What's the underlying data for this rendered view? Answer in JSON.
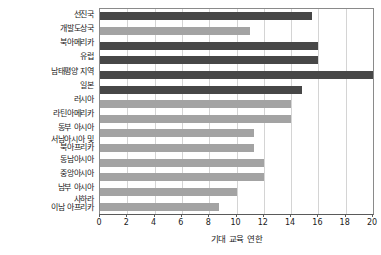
{
  "chart_data": {
    "type": "bar",
    "orientation": "horizontal",
    "title": "",
    "xlabel": "기대 교육 연한",
    "ylabel": "",
    "xlim": [
      0,
      20
    ],
    "xticks": [
      0,
      2,
      4,
      6,
      8,
      10,
      12,
      14,
      16,
      18,
      20
    ],
    "xticklabels": [
      "0",
      "2",
      "4",
      "6",
      "8",
      "10",
      "12",
      "14",
      "16",
      "18",
      "20"
    ],
    "grid": "vertical",
    "legend": "none",
    "colors": {
      "dark": "#474747",
      "light": "#a3a3a3",
      "gridline": "#d4d4d4",
      "axis": "#5a5a5a",
      "frame": "#8a8a8a",
      "background": "#ffffff",
      "text": "#1a1a1a"
    },
    "categories": [
      "선진국",
      "개발도상국",
      "북아메리카",
      "유럽",
      "남태평양 지역",
      "일본",
      "러시아",
      "라틴아메리카",
      "동부 아시아",
      "서남아시아 및\n북아프리카",
      "동남아시아",
      "중앙아시아",
      "남부 아시아",
      "사하라\n이남 아프리카"
    ],
    "values": [
      15.5,
      11.0,
      16.0,
      16.0,
      20.0,
      14.8,
      14.0,
      14.0,
      11.3,
      11.3,
      12.0,
      12.0,
      10.0,
      8.7
    ],
    "bars": [
      {
        "label": "선진국",
        "value": 15.5,
        "color": "dark"
      },
      {
        "label": "개발도상국",
        "value": 11.0,
        "color": "light"
      },
      {
        "label": "북아메리카",
        "value": 16.0,
        "color": "dark"
      },
      {
        "label": "유럽",
        "value": 16.0,
        "color": "dark"
      },
      {
        "label": "남태평양 지역",
        "value": 20.0,
        "color": "dark"
      },
      {
        "label": "일본",
        "value": 14.8,
        "color": "dark"
      },
      {
        "label": "러시아",
        "value": 14.0,
        "color": "light"
      },
      {
        "label": "라틴아메리카",
        "value": 14.0,
        "color": "light"
      },
      {
        "label": "동부 아시아",
        "value": 11.3,
        "color": "light"
      },
      {
        "label": "서남아시아 및\n북아프리카",
        "value": 11.3,
        "color": "light"
      },
      {
        "label": "동남아시아",
        "value": 12.0,
        "color": "light"
      },
      {
        "label": "중앙아시아",
        "value": 12.0,
        "color": "light"
      },
      {
        "label": "남부 아시아",
        "value": 10.0,
        "color": "light"
      },
      {
        "label": "사하라\n이남 아프리카",
        "value": 8.7,
        "color": "light"
      }
    ]
  }
}
